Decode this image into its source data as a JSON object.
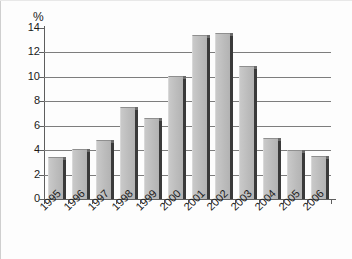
{
  "chart_data": {
    "type": "bar",
    "title": "",
    "subtitle": "",
    "xlabel": "",
    "ylabel": "",
    "unit_label": "%",
    "categories": [
      "1995",
      "1996",
      "1997",
      "1998",
      "1999",
      "2000",
      "2001",
      "2002",
      "2003",
      "2004",
      "2005",
      "2006"
    ],
    "values": [
      3.4,
      4.1,
      4.8,
      7.5,
      6.6,
      10.1,
      13.4,
      13.6,
      10.9,
      5.0,
      4.0,
      3.5
    ],
    "series": [
      {
        "name": "",
        "values": [
          3.4,
          4.1,
          4.8,
          7.5,
          6.6,
          10.1,
          13.4,
          13.6,
          10.9,
          5.0,
          4.0,
          3.5
        ]
      }
    ],
    "ylim": [
      0,
      14
    ],
    "yticks": [
      0,
      2,
      4,
      6,
      8,
      10,
      12,
      14
    ],
    "ytick_labels": [
      "0",
      "2",
      "4",
      "6",
      "8",
      "10",
      "12",
      "14"
    ],
    "grid": true,
    "grid_axis": "y",
    "legend": false,
    "legend_position": "none",
    "annotations": [],
    "bar_color": "#c0c0c0",
    "bar_shadow_color": "#3a3a3a",
    "axis_color": "#5e5e5e",
    "gridline_color": "#7d7d7d",
    "background_color": "#ffffff",
    "text_color": "#1a1a1a",
    "xtick_label_rotation": -45
  }
}
